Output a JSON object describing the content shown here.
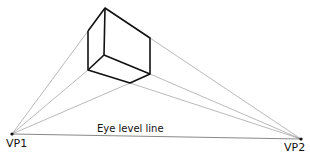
{
  "diagram": {
    "eye_level_label": "Eye level line",
    "vanishing_points": [
      {
        "id": "vp1",
        "label": "VP1",
        "x": 12,
        "y": 134
      },
      {
        "id": "vp2",
        "label": "VP2",
        "x": 301,
        "y": 139
      }
    ],
    "box_vertices": {
      "top": [
        105,
        8
      ],
      "left_top": [
        88,
        31
      ],
      "left_bottom": [
        88,
        70
      ],
      "inner": [
        104,
        55
      ],
      "right_top": [
        150,
        38
      ],
      "right_bottom": [
        150,
        74
      ],
      "bottom": [
        130,
        83
      ]
    },
    "colors": {
      "box_stroke": "#111111",
      "guide_stroke": "#8a8a8a",
      "horizon_stroke": "#555555"
    }
  }
}
